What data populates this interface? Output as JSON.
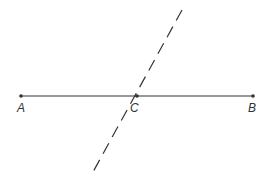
{
  "diagram": {
    "type": "geometry",
    "segment": {
      "from": "A",
      "to": "B",
      "style": "solid"
    },
    "points": [
      {
        "label": "A",
        "x": 21,
        "y": 96
      },
      {
        "label": "C",
        "x": 137,
        "y": 96
      },
      {
        "label": "B",
        "x": 253,
        "y": 96
      }
    ],
    "dashed_line": {
      "x1": 182,
      "y1": 10,
      "x2": 93,
      "y2": 172,
      "passes_through": "C"
    },
    "colors": {
      "line": "#333333",
      "background": "#ffffff"
    }
  },
  "labels": {
    "a": "A",
    "b": "B",
    "c": "C"
  }
}
